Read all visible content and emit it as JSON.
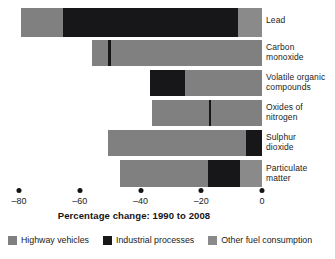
{
  "chart_data": {
    "type": "bar",
    "orientation": "horizontal",
    "stacked": true,
    "title": "",
    "xlabel": "Percentage change: 1990 to 2008",
    "ylabel": "",
    "xlim": [
      -88,
      2
    ],
    "xticks": [
      -80,
      -60,
      -40,
      -20,
      0
    ],
    "xtick_labels": [
      "–80",
      "–60",
      "–40",
      "–20",
      "0"
    ],
    "grid": false,
    "legend_position": "bottom",
    "categories": [
      "Lead",
      "Carbon monoxide",
      "Volatile organic compounds",
      "Oxides of nitrogen",
      "Sulphur dioxide",
      "Particulate matter"
    ],
    "series": [
      {
        "name": "Highway vehicles",
        "color": "#808080",
        "values": [
          -13.9,
          -53.6,
          -25.3,
          -36.2,
          -45.4,
          -28.9
        ]
      },
      {
        "name": "Industrial processes",
        "color": "#17171a",
        "values": [
          -57.6,
          -2.3,
          -11.5,
          0.0,
          -5.3,
          -10.6
        ]
      },
      {
        "name": "Other fuel consumption",
        "color": "#8a8a8a",
        "values": [
          -7.9,
          0.0,
          0.0,
          0.0,
          0.0,
          -7.2
        ]
      }
    ],
    "totals": [
      -79.4,
      -55.9,
      -36.8,
      -36.2,
      -50.7,
      -46.7
    ],
    "bars": [
      {
        "category": "Lead",
        "total": -79.4,
        "segments": [
          {
            "series": "Highway vehicles",
            "start": -79.4,
            "end": -65.5
          },
          {
            "series": "Industrial processes",
            "start": -65.5,
            "end": -7.9
          },
          {
            "series": "Other fuel consumption",
            "start": -7.9,
            "end": 0
          }
        ]
      },
      {
        "category": "Carbon monoxide",
        "total": -55.9,
        "segments": [
          {
            "series": "Highway vehicles",
            "start": -55.9,
            "end": -50.7
          },
          {
            "series": "Industrial processes",
            "start": -50.7,
            "end": -49.7
          },
          {
            "series": "Highway vehicles",
            "start": -49.7,
            "end": 0
          }
        ]
      },
      {
        "category": "Volatile organic compounds",
        "total": -36.8,
        "segments": [
          {
            "series": "Industrial processes",
            "start": -36.8,
            "end": -25.3
          },
          {
            "series": "Highway vehicles",
            "start": -25.3,
            "end": 0
          }
        ]
      },
      {
        "category": "Oxides of nitrogen",
        "total": -36.2,
        "segments": [
          {
            "series": "Highway vehicles",
            "start": -36.2,
            "end": -17.4
          },
          {
            "series": "Industrial processes",
            "start": -17.4,
            "end": -16.8
          },
          {
            "series": "Highway vehicles",
            "start": -16.8,
            "end": 0
          }
        ]
      },
      {
        "category": "Sulphur dioxide",
        "total": -50.7,
        "segments": [
          {
            "series": "Highway vehicles",
            "start": -50.7,
            "end": -5.3
          },
          {
            "series": "Industrial processes",
            "start": -5.3,
            "end": 0
          }
        ]
      },
      {
        "category": "Particulate matter",
        "total": -46.7,
        "segments": [
          {
            "series": "Highway vehicles",
            "start": -46.7,
            "end": -17.8
          },
          {
            "series": "Industrial processes",
            "start": -17.8,
            "end": -7.2
          },
          {
            "series": "Other fuel consumption",
            "start": -7.2,
            "end": 0
          }
        ]
      }
    ]
  },
  "axis": {
    "title": "Percentage change: 1990 to 2008",
    "ticks": [
      {
        "value": -80,
        "label": "–80"
      },
      {
        "value": -60,
        "label": "–60"
      },
      {
        "value": -40,
        "label": "–40"
      },
      {
        "value": -20,
        "label": "–20"
      },
      {
        "value": 0,
        "label": "0"
      }
    ]
  },
  "categories": [
    {
      "line1": "Lead",
      "line2": ""
    },
    {
      "line1": "Carbon",
      "line2": "monoxide"
    },
    {
      "line1": "Volatile organic",
      "line2": "compounds"
    },
    {
      "line1": "Oxides of",
      "line2": "nitrogen"
    },
    {
      "line1": "Sulphur",
      "line2": "dioxide"
    },
    {
      "line1": "Particulate",
      "line2": "matter"
    }
  ],
  "legend": [
    {
      "label": "Highway vehicles",
      "color": "#808080",
      "key": "highway"
    },
    {
      "label": "Industrial processes",
      "color": "#17171a",
      "key": "industrial"
    },
    {
      "label": "Other fuel consumption",
      "color": "#8a8a8a",
      "key": "other"
    }
  ]
}
